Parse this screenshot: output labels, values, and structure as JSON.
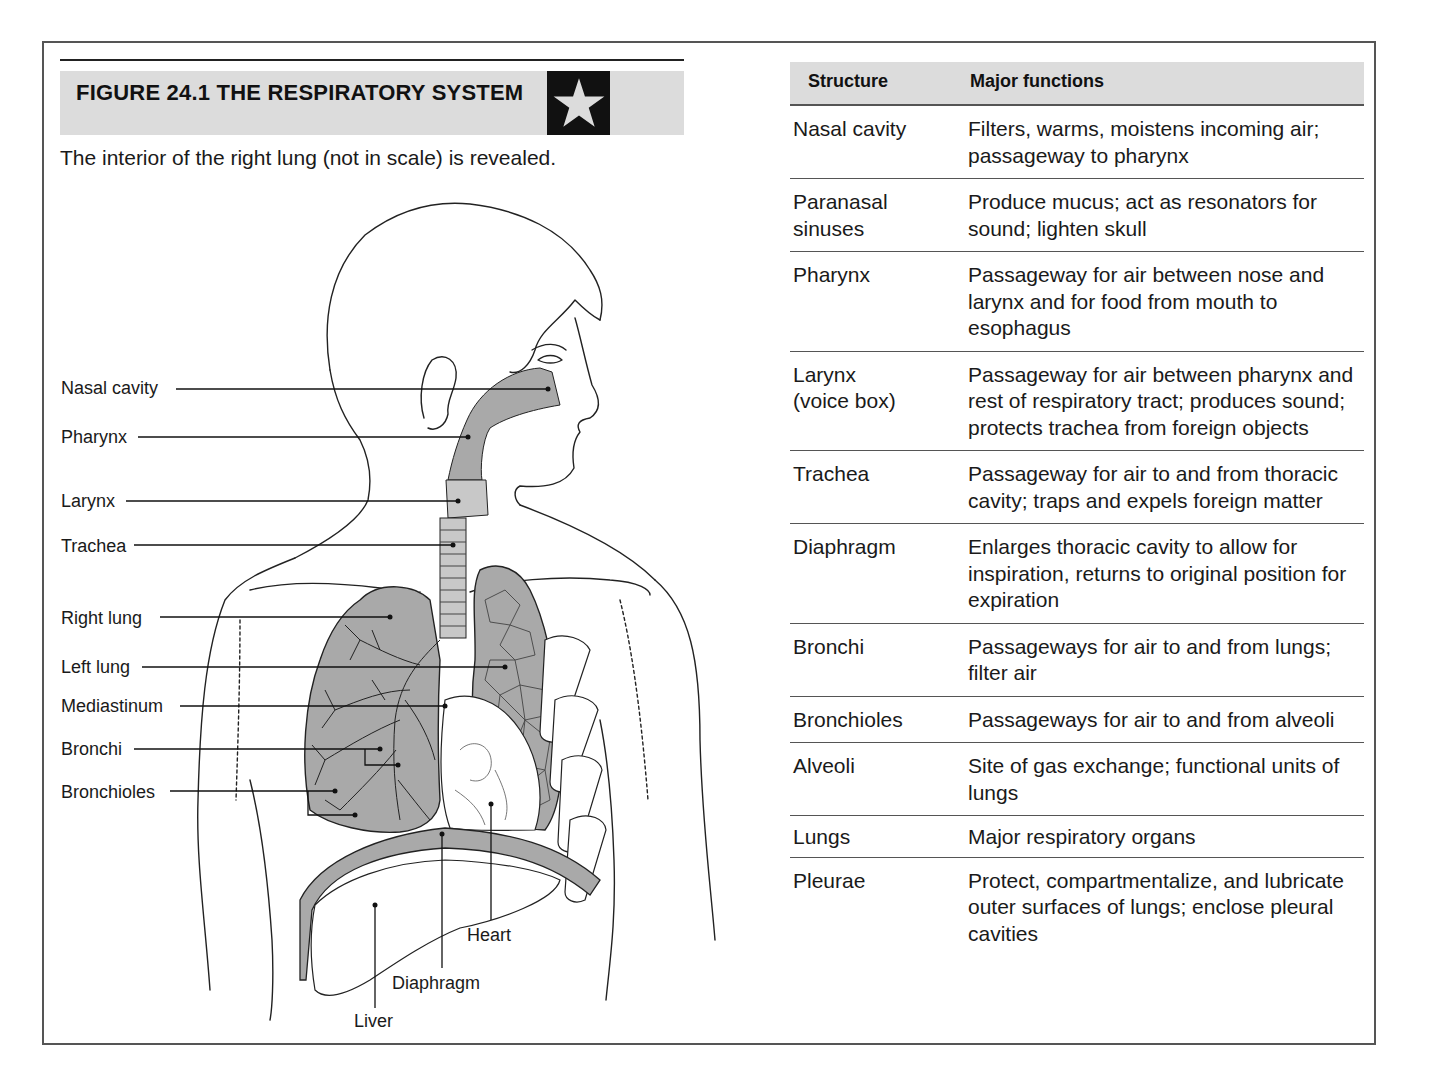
{
  "figure": {
    "title": "FIGURE 24.1  THE RESPIRATORY SYSTEM",
    "icon": "star-icon",
    "caption": "The interior of the right lung (not in scale) is revealed.",
    "colors": {
      "header_bg": "#dcdcdc",
      "star_box": "#111111",
      "star": "#dcdcdc",
      "tissue_shade": "#a9a9a9",
      "frame": "#555555"
    }
  },
  "diagram_labels": {
    "nasal_cavity": "Nasal cavity",
    "pharynx": "Pharynx",
    "larynx": "Larynx",
    "trachea": "Trachea",
    "right_lung": "Right lung",
    "left_lung": "Left lung",
    "mediastinum": "Mediastinum",
    "bronchi": "Bronchi",
    "bronchioles": "Bronchioles",
    "heart": "Heart",
    "diaphragm": "Diaphragm",
    "liver": "Liver"
  },
  "table": {
    "headers": {
      "structure": "Structure",
      "functions": "Major functions"
    },
    "rows": [
      {
        "structure": "Nasal cavity",
        "function": "Filters, warms, moistens incoming air; passageway to pharynx"
      },
      {
        "structure": "Paranasal sinuses",
        "function": "Produce mucus; act as resonators for sound; lighten skull"
      },
      {
        "structure": "Pharynx",
        "function": "Passageway for air between nose and larynx and for food from mouth to esophagus"
      },
      {
        "structure": "Larynx (voice box)",
        "function": "Passageway for air between pharynx and rest of respiratory tract; produces sound; protects trachea from foreign objects"
      },
      {
        "structure": "Trachea",
        "function": "Passageway for air to and from thoracic cavity; traps and expels foreign matter"
      },
      {
        "structure": "Diaphragm",
        "function": "Enlarges thoracic cavity to allow for inspiration, returns to original position for expiration"
      },
      {
        "structure": "Bronchi",
        "function": "Passageways for air to and from lungs; filter air"
      },
      {
        "structure": "Bronchioles",
        "function": "Passageways for air to and from alveoli"
      },
      {
        "structure": "Alveoli",
        "function": "Site of gas exchange; functional units of lungs"
      },
      {
        "structure": "Lungs",
        "function": "Major respiratory organs"
      },
      {
        "structure": "Pleurae",
        "function": "Protect, compartmentalize, and lubricate outer surfaces of lungs; enclose pleural cavities"
      }
    ]
  }
}
